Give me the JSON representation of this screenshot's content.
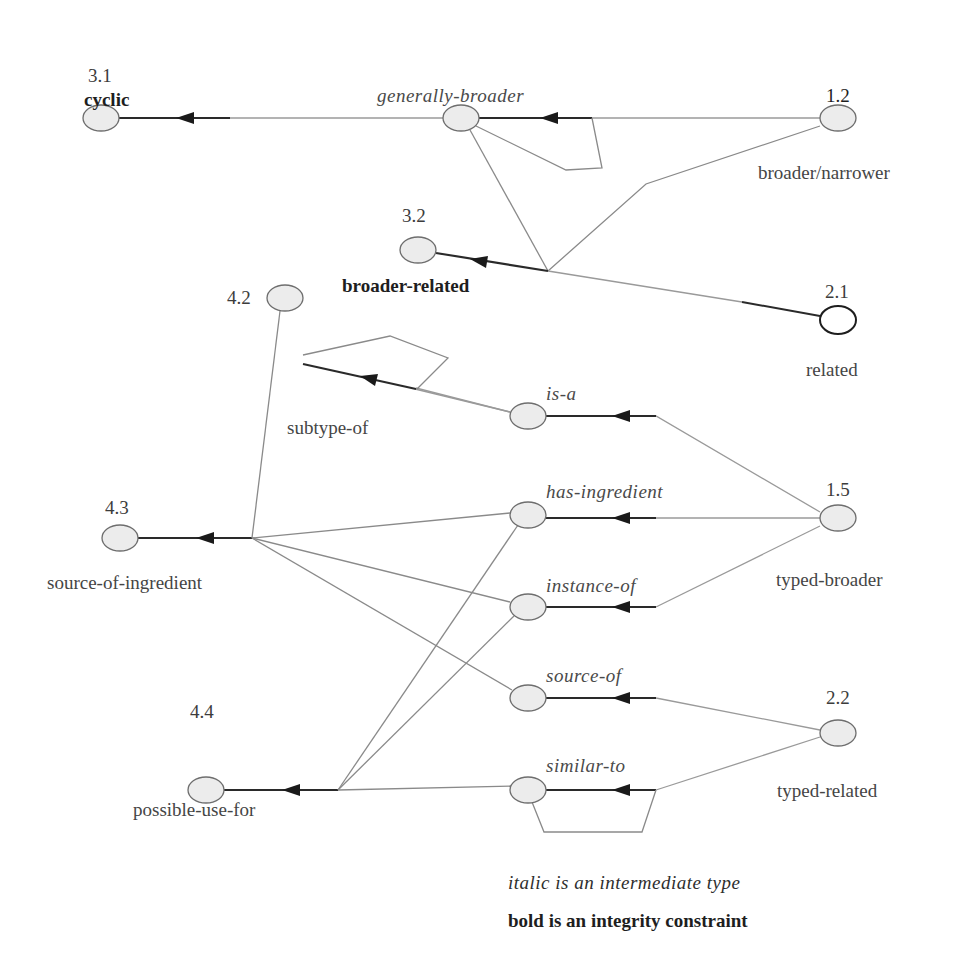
{
  "diagram": {
    "nodes": [
      {
        "id": "3.1",
        "number": "3.1",
        "label": "cyclic",
        "style": "bold"
      },
      {
        "id": "gb",
        "number": "",
        "label": "generally-broader",
        "style": "italic"
      },
      {
        "id": "1.2",
        "number": "1.2",
        "label": "broader/narrower",
        "style": "plain"
      },
      {
        "id": "3.2",
        "number": "3.2",
        "label": "broader-related",
        "style": "bold"
      },
      {
        "id": "2.1",
        "number": "2.1",
        "label": "related",
        "style": "plain"
      },
      {
        "id": "4.2",
        "number": "4.2",
        "label": "subtype-of",
        "style": "plain"
      },
      {
        "id": "isa",
        "number": "",
        "label": "is-a",
        "style": "italic"
      },
      {
        "id": "4.3",
        "number": "4.3",
        "label": "source-of-ingredient",
        "style": "plain"
      },
      {
        "id": "hi",
        "number": "",
        "label": "has-ingredient",
        "style": "italic"
      },
      {
        "id": "1.5",
        "number": "1.5",
        "label": "typed-broader",
        "style": "plain"
      },
      {
        "id": "io",
        "number": "",
        "label": "instance-of",
        "style": "italic"
      },
      {
        "id": "so",
        "number": "",
        "label": "source-of",
        "style": "italic"
      },
      {
        "id": "2.2",
        "number": "2.2",
        "label": "typed-related",
        "style": "plain"
      },
      {
        "id": "4.4",
        "number": "4.4",
        "label": "possible-use-for",
        "style": "plain"
      },
      {
        "id": "st",
        "number": "",
        "label": "similar-to",
        "style": "italic"
      }
    ],
    "edges": [
      {
        "from": "1.2",
        "to": "gb"
      },
      {
        "from": "gb",
        "to": "3.1"
      },
      {
        "from": "gb",
        "to": "gb",
        "type": "self-loop"
      },
      {
        "from": "gb",
        "to": "3.2",
        "via": "junction"
      },
      {
        "from": "1.2",
        "to": "3.2",
        "via": "junction"
      },
      {
        "from": "2.1",
        "to": "3.2",
        "via": "junction"
      },
      {
        "from": "1.5",
        "to": "isa"
      },
      {
        "from": "isa",
        "to": "4.2"
      },
      {
        "from": "4.2",
        "to": "4.2",
        "type": "self-loop"
      },
      {
        "from": "1.5",
        "to": "hi"
      },
      {
        "from": "1.5",
        "to": "io"
      },
      {
        "from": "4.2",
        "to": "4.3",
        "via": "junction"
      },
      {
        "from": "hi",
        "to": "4.3",
        "via": "junction"
      },
      {
        "from": "io",
        "to": "4.3",
        "via": "junction"
      },
      {
        "from": "so",
        "to": "4.3",
        "via": "junction"
      },
      {
        "from": "2.2",
        "to": "so"
      },
      {
        "from": "2.2",
        "to": "st"
      },
      {
        "from": "st",
        "to": "st",
        "type": "self-loop"
      },
      {
        "from": "hi",
        "to": "4.4",
        "via": "junction"
      },
      {
        "from": "io",
        "to": "4.4",
        "via": "junction"
      },
      {
        "from": "st",
        "to": "4.4",
        "via": "junction"
      }
    ]
  },
  "labels": {
    "n31_num": "3.1",
    "n31_name": "cyclic",
    "gb_name": "generally-broader",
    "n12_num": "1.2",
    "n12_name": "broader/narrower",
    "n32_num": "3.2",
    "n32_name": "broader-related",
    "n21_num": "2.1",
    "n21_name": "related",
    "n42_num": "4.2",
    "n42_name": "subtype-of",
    "isa_name": "is-a",
    "n43_num": "4.3",
    "n43_name": "source-of-ingredient",
    "hi_name": "has-ingredient",
    "n15_num": "1.5",
    "n15_name": "typed-broader",
    "io_name": "instance-of",
    "so_name": "source-of",
    "n22_num": "2.2",
    "n22_name": "typed-related",
    "n44_num": "4.4",
    "n44_name": "possible-use-for",
    "st_name": "similar-to"
  },
  "legend": {
    "italic": "italic is an intermediate type",
    "bold": "bold is an integrity constraint"
  },
  "colors": {
    "node_fill": "#ececec",
    "node_stroke": "#6e6e6e",
    "line_light": "#8a8a8a",
    "line_dark": "#2a2a2a"
  }
}
